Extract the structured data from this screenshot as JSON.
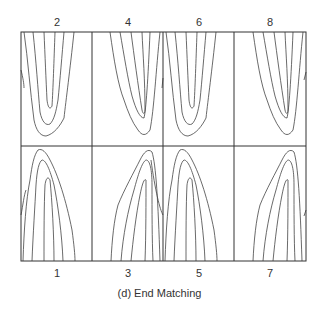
{
  "figure": {
    "caption": "(d) End Matching",
    "top_labels": [
      "2",
      "4",
      "6",
      "8"
    ],
    "bottom_labels": [
      "1",
      "3",
      "5",
      "7"
    ],
    "grid": {
      "rows": 2,
      "cols": 4
    },
    "colors": {
      "line": "#333333",
      "contour": "#444444",
      "background": "#ffffff"
    },
    "panels_top": [
      {
        "label": "2",
        "orientation": "down",
        "skew": "left"
      },
      {
        "label": "4",
        "orientation": "down",
        "skew": "right"
      },
      {
        "label": "6",
        "orientation": "down",
        "skew": "left"
      },
      {
        "label": "8",
        "orientation": "down",
        "skew": "right"
      }
    ],
    "panels_bottom": [
      {
        "label": "1",
        "orientation": "up",
        "skew": "left"
      },
      {
        "label": "3",
        "orientation": "up",
        "skew": "right"
      },
      {
        "label": "5",
        "orientation": "up",
        "skew": "left"
      },
      {
        "label": "7",
        "orientation": "up",
        "skew": "right"
      }
    ]
  }
}
